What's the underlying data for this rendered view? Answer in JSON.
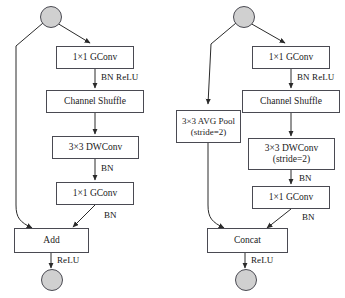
{
  "figure": {
    "type": "neural-network-block-diagram",
    "colors": {
      "box_border": "#4a4a52",
      "box_fill": "#ffffff",
      "circle_fill": "#d0d0d0",
      "edge": "#2a2a2a",
      "text": "#1a1a1a"
    }
  },
  "left_unit": {
    "name": "shufflenet-unit-stride1",
    "start_node": "input-feature-map",
    "end_node": "output-feature-map",
    "blocks": [
      {
        "id": "l-gconv1",
        "label": "1×1 GConv",
        "sub": ""
      },
      {
        "id": "l-shuffle",
        "label": "Channel Shuffle",
        "sub": ""
      },
      {
        "id": "l-dwconv",
        "label": "3×3 DWConv",
        "sub": ""
      },
      {
        "id": "l-gconv2",
        "label": "1×1 GConv",
        "sub": ""
      },
      {
        "id": "l-merge",
        "label": "Add",
        "sub": ""
      }
    ],
    "edge_labels": [
      {
        "id": "l-bnrelu",
        "text": "BN ReLU"
      },
      {
        "id": "l-bn1",
        "text": "BN"
      },
      {
        "id": "l-bn2",
        "text": "BN"
      },
      {
        "id": "l-relu-out",
        "text": "ReLU"
      }
    ]
  },
  "right_unit": {
    "name": "shufflenet-unit-stride2",
    "start_node": "input-feature-map",
    "end_node": "output-feature-map",
    "blocks": [
      {
        "id": "r-gconv1",
        "label": "1×1 GConv",
        "sub": ""
      },
      {
        "id": "r-shuffle",
        "label": "Channel Shuffle",
        "sub": ""
      },
      {
        "id": "r-dwconv",
        "label": "3×3 DWConv",
        "sub": "(stride=2)"
      },
      {
        "id": "r-gconv2",
        "label": "1×1 GConv",
        "sub": ""
      },
      {
        "id": "r-avgpool",
        "label": "3×3 AVG Pool",
        "sub": "(stride=2)"
      },
      {
        "id": "r-merge",
        "label": "Concat",
        "sub": ""
      }
    ],
    "edge_labels": [
      {
        "id": "r-bnrelu",
        "text": "BN ReLU"
      },
      {
        "id": "r-bn1",
        "text": "BN"
      },
      {
        "id": "r-bn2",
        "text": "BN"
      },
      {
        "id": "r-relu-out",
        "text": "ReLU"
      }
    ]
  }
}
